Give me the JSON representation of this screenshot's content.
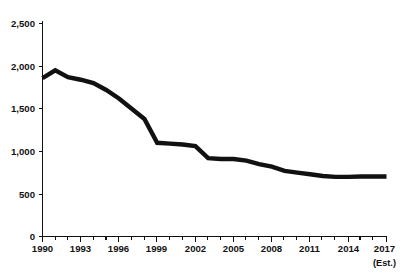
{
  "chart_data": {
    "type": "line",
    "title": "",
    "subtitle": "",
    "xlabel": "",
    "ylabel": "",
    "grid": false,
    "legend": false,
    "legend_position": "none",
    "line_color": "#111111",
    "axis_color": "#111111",
    "background": "#ffffff",
    "xlim": [
      1990,
      2017
    ],
    "ylim": [
      0,
      2500
    ],
    "y_ticks": [
      0,
      500,
      1000,
      1500,
      2000,
      2500
    ],
    "y_tick_labels": [
      "0",
      "500",
      "1,000",
      "1,500",
      "2,000",
      "2,500"
    ],
    "x_ticks": [
      1990,
      1993,
      1996,
      1999,
      2002,
      2005,
      2008,
      2011,
      2014,
      2017
    ],
    "x_tick_labels": [
      "1990",
      "1993",
      "1996",
      "1999",
      "2002",
      "2005",
      "2008",
      "2011",
      "2014",
      "2017"
    ],
    "x_minor_ticks": [
      1991,
      1992,
      1994,
      1995,
      1997,
      1998,
      2000,
      2001,
      2003,
      2004,
      2006,
      2007,
      2009,
      2010,
      2012,
      2013,
      2015,
      2016
    ],
    "x_last_tick_note": "(Est.)",
    "x": [
      1990,
      1991,
      1992,
      1993,
      1994,
      1995,
      1996,
      1997,
      1998,
      1999,
      2000,
      2001,
      2002,
      2003,
      2004,
      2005,
      2006,
      2007,
      2008,
      2009,
      2010,
      2011,
      2012,
      2013,
      2014,
      2015,
      2016,
      2017
    ],
    "values": [
      1860,
      1950,
      1870,
      1840,
      1800,
      1720,
      1620,
      1500,
      1380,
      1100,
      1090,
      1080,
      1060,
      920,
      910,
      910,
      890,
      850,
      820,
      770,
      750,
      730,
      710,
      700,
      700,
      705,
      705,
      705
    ],
    "series": [
      {
        "name": "series-1",
        "values": [
          1860,
          1950,
          1870,
          1840,
          1800,
          1720,
          1620,
          1500,
          1380,
          1100,
          1090,
          1080,
          1060,
          920,
          910,
          910,
          890,
          850,
          820,
          770,
          750,
          730,
          710,
          700,
          700,
          705,
          705,
          705
        ]
      }
    ]
  },
  "axes": {
    "y_labels": [
      "2,500",
      "2,000",
      "1,500",
      "1,000",
      "500",
      "0"
    ],
    "x_labels": [
      "1990",
      "1993",
      "1996",
      "1999",
      "2002",
      "2005",
      "2008",
      "2011",
      "2014",
      "2017"
    ],
    "x_note": "(Est.)"
  }
}
